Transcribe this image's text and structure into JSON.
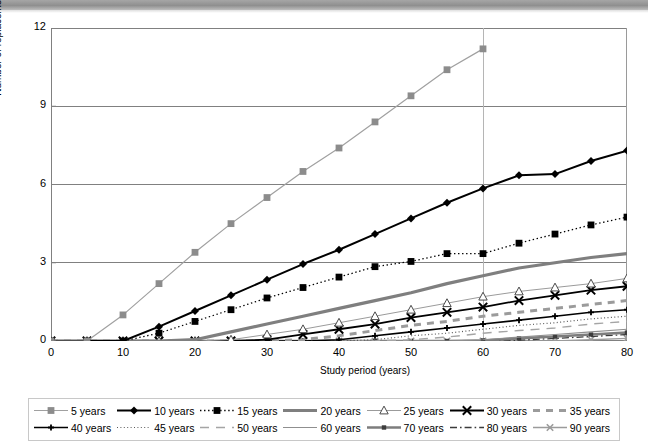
{
  "figure": {
    "background_color": "#ffffff",
    "banner_color": "#9a9a9a"
  },
  "chart_data": {
    "type": "line",
    "title": "",
    "subtitle": "",
    "xlabel": "Study period (years)",
    "ylabel": "Number of replacements",
    "xlim": [
      0,
      80
    ],
    "ylim": [
      0,
      12
    ],
    "xticks": [
      0,
      10,
      20,
      30,
      40,
      50,
      60,
      70,
      80
    ],
    "yticks": [
      0,
      3,
      6,
      9,
      12
    ],
    "grid": "horizontal gridlines at 3,6,9,12 plus vertical gridline at x=60",
    "legend_position": "below plot, 2 rows x 7 columns, bordered box",
    "x": [
      0,
      5,
      10,
      15,
      20,
      25,
      30,
      35,
      40,
      45,
      50,
      55,
      60,
      65,
      70,
      75,
      80
    ],
    "series": [
      {
        "name": "5 years",
        "color": "#a0a0a0",
        "line_style": "solid",
        "line_width": 1.2,
        "marker": "square",
        "marker_fill": "#8c8c8c",
        "values": [
          0,
          0,
          1.0,
          2.2,
          3.4,
          4.5,
          5.5,
          6.5,
          7.4,
          8.4,
          9.4,
          10.4,
          11.2,
          null,
          null,
          null,
          null
        ]
      },
      {
        "name": "10 years",
        "color": "#000000",
        "line_style": "solid",
        "line_width": 2.0,
        "marker": "diamond",
        "marker_fill": "#000000",
        "values": [
          0,
          0,
          0,
          0.55,
          1.15,
          1.75,
          2.35,
          2.95,
          3.5,
          4.1,
          4.7,
          5.3,
          5.85,
          6.35,
          6.4,
          6.9,
          7.3
        ]
      },
      {
        "name": "15 years",
        "color": "#000000",
        "line_style": "dotted",
        "line_width": 1.3,
        "marker": "square",
        "marker_fill": "#000000",
        "values": [
          0,
          0,
          0,
          0.3,
          0.75,
          1.2,
          1.65,
          2.05,
          2.45,
          2.85,
          3.05,
          3.35,
          3.35,
          3.75,
          4.1,
          4.45,
          4.75
        ]
      },
      {
        "name": "20 years",
        "color": "#7f7f7f",
        "line_style": "solid",
        "line_width": 3.2,
        "marker": "none",
        "marker_fill": "#7f7f7f",
        "values": [
          0,
          0,
          0,
          0,
          0.05,
          0.35,
          0.65,
          0.95,
          1.25,
          1.55,
          1.85,
          2.2,
          2.5,
          2.8,
          3.0,
          3.2,
          3.35
        ]
      },
      {
        "name": "25 years",
        "color": "#9b9b9b",
        "line_style": "solid",
        "line_width": 1.0,
        "marker": "triangle-open",
        "marker_fill": "#ffffff",
        "values": [
          0,
          0,
          0,
          0,
          0,
          0.05,
          0.25,
          0.45,
          0.7,
          0.95,
          1.2,
          1.45,
          1.7,
          1.9,
          2.05,
          2.2,
          2.4
        ]
      },
      {
        "name": "30 years",
        "color": "#000000",
        "line_style": "solid",
        "line_width": 1.8,
        "marker": "x",
        "marker_fill": "#000000",
        "values": [
          0,
          0,
          0,
          0,
          0,
          0,
          0.05,
          0.25,
          0.45,
          0.65,
          0.9,
          1.1,
          1.3,
          1.55,
          1.75,
          1.95,
          2.1
        ]
      },
      {
        "name": "35 years",
        "color": "#9b9b9b",
        "line_style": "thick-dash",
        "line_width": 3.0,
        "marker": "none",
        "marker_fill": "#9b9b9b",
        "values": [
          0,
          0,
          0,
          0,
          0,
          0,
          0,
          0.05,
          0.2,
          0.4,
          0.6,
          0.75,
          0.95,
          1.1,
          1.25,
          1.4,
          1.55
        ]
      },
      {
        "name": "40 years",
        "color": "#000000",
        "line_style": "solid",
        "line_width": 1.6,
        "marker": "plus-small",
        "marker_fill": "#000000",
        "values": [
          0,
          0,
          0,
          0,
          0,
          0,
          0,
          0,
          0.05,
          0.2,
          0.35,
          0.5,
          0.65,
          0.8,
          0.95,
          1.1,
          1.2
        ]
      },
      {
        "name": "45 years",
        "color": "#5a5a5a",
        "line_style": "fine-dotted",
        "line_width": 1.2,
        "marker": "none",
        "marker_fill": "#5a5a5a",
        "values": [
          0,
          0,
          0,
          0,
          0,
          0,
          0,
          0,
          0,
          0.05,
          0.2,
          0.3,
          0.45,
          0.6,
          0.7,
          0.85,
          0.95
        ]
      },
      {
        "name": "50 years",
        "color": "#a5a5a5",
        "line_style": "long-dash",
        "line_width": 1.4,
        "marker": "none",
        "marker_fill": "#a5a5a5",
        "values": [
          0,
          0,
          0,
          0,
          0,
          0,
          0,
          0,
          0,
          0,
          0.05,
          0.15,
          0.3,
          0.4,
          0.5,
          0.65,
          0.75
        ]
      },
      {
        "name": "60 years",
        "color": "#8f8f8f",
        "line_style": "solid",
        "line_width": 1.1,
        "marker": "none",
        "marker_fill": "#8f8f8f",
        "values": [
          0,
          0,
          0,
          0,
          0,
          0,
          0,
          0,
          0,
          0,
          0,
          0,
          0.05,
          0.15,
          0.25,
          0.35,
          0.45
        ]
      },
      {
        "name": "70 years",
        "color": "#7d7d7d",
        "line_style": "solid",
        "line_width": 2.6,
        "marker": "square-small",
        "marker_fill": "#3c3c3c",
        "values": [
          0,
          0,
          0,
          0,
          0,
          0,
          0,
          0,
          0,
          0,
          0,
          0,
          0.02,
          0.1,
          0.17,
          0.25,
          0.32
        ]
      },
      {
        "name": "80 years",
        "color": "#3b3b3b",
        "line_style": "dash-dot",
        "line_width": 1.3,
        "marker": "none",
        "marker_fill": "#3b3b3b",
        "values": [
          0,
          0,
          0,
          0,
          0,
          0,
          0,
          0,
          0,
          0,
          0,
          0,
          0,
          0.03,
          0.1,
          0.17,
          0.25
        ]
      },
      {
        "name": "90 years",
        "color": "#9b9b9b",
        "line_style": "solid",
        "line_width": 1.4,
        "marker": "x-small",
        "marker_fill": "#000000",
        "values": [
          0,
          0,
          0,
          0,
          0,
          0,
          0,
          0,
          0,
          0,
          0,
          0,
          0,
          0,
          0.0,
          0.05,
          0.1
        ]
      }
    ]
  },
  "legend": {
    "rows": [
      [
        "5 years",
        "10 years",
        "15 years",
        "20 years",
        "25 years",
        "30 years",
        "35 years"
      ],
      [
        "40 years",
        "45 years",
        "50 years",
        "60 years",
        "70 years",
        "80 years",
        "90 years"
      ]
    ]
  }
}
